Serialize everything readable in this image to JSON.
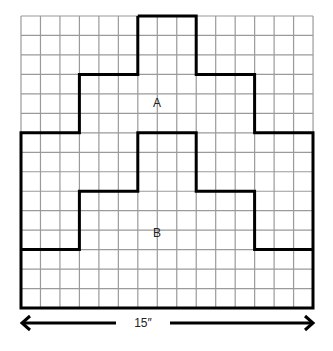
{
  "diagram": {
    "grid": {
      "cols": 15,
      "rows": 15,
      "left": 21,
      "top": 16,
      "cell": 19.47,
      "line_color": "#9a9a9a",
      "outline_color": "#000000"
    },
    "region_a": {
      "label": "A",
      "x": 157,
      "y": 103
    },
    "region_b": {
      "label": "B",
      "x": 157,
      "y": 233
    },
    "outer_outline": [
      [
        6,
        0
      ],
      [
        9,
        0
      ],
      [
        9,
        3
      ],
      [
        12,
        3
      ],
      [
        12,
        6
      ],
      [
        15,
        6
      ],
      [
        15,
        15
      ],
      [
        0,
        15
      ],
      [
        0,
        6
      ],
      [
        3,
        6
      ],
      [
        3,
        3
      ],
      [
        6,
        3
      ],
      [
        6,
        0
      ]
    ],
    "inner_outline": [
      [
        0,
        12
      ],
      [
        3,
        12
      ],
      [
        3,
        9
      ],
      [
        6,
        9
      ],
      [
        6,
        6
      ],
      [
        9,
        6
      ],
      [
        9,
        9
      ],
      [
        12,
        9
      ],
      [
        12,
        12
      ],
      [
        15,
        12
      ]
    ],
    "dimension": {
      "label": "15″",
      "x": 165,
      "y": 323
    }
  }
}
